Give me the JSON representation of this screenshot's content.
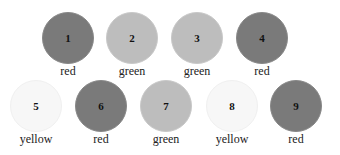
{
  "rows": [
    [
      {
        "number": "1",
        "label": "red",
        "color": "red",
        "x": 38,
        "y": 12
      },
      {
        "number": "2",
        "label": "green",
        "color": "green",
        "x": 102,
        "y": 12
      },
      {
        "number": "3",
        "label": "green",
        "color": "green",
        "x": 167,
        "y": 12
      },
      {
        "number": "4",
        "label": "red",
        "color": "red",
        "x": 232,
        "y": 12
      }
    ],
    [
      {
        "number": "5",
        "label": "yellow",
        "color": "yellow",
        "x": 6,
        "y": 80
      },
      {
        "number": "6",
        "label": "red",
        "color": "red",
        "x": 71,
        "y": 80
      },
      {
        "number": "7",
        "label": "green",
        "color": "green",
        "x": 136,
        "y": 80
      },
      {
        "number": "8",
        "label": "yellow",
        "color": "yellow",
        "x": 202,
        "y": 80
      },
      {
        "number": "9",
        "label": "red",
        "color": "red",
        "x": 266,
        "y": 80
      }
    ]
  ],
  "colors": {
    "red": "#7a7a7a",
    "green": "#bdbdbd",
    "yellow": "#f7f7f7"
  }
}
